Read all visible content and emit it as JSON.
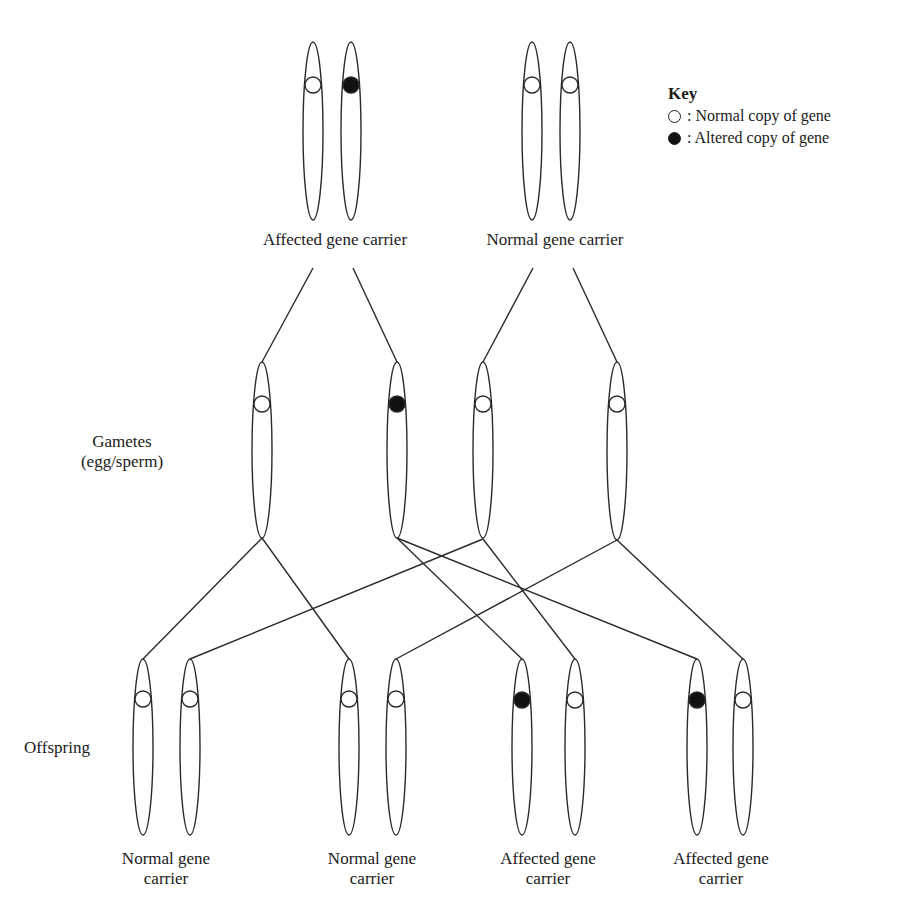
{
  "key": {
    "title": "Key",
    "items": [
      {
        "symbol": "open-circle",
        "label": ": Normal copy of gene"
      },
      {
        "symbol": "filled-circle",
        "label": ": Altered copy of gene"
      }
    ]
  },
  "parents": [
    {
      "label": "Affected gene carrier",
      "alleles": [
        "normal",
        "altered"
      ]
    },
    {
      "label": "Normal gene carrier",
      "alleles": [
        "normal",
        "normal"
      ]
    }
  ],
  "rows": {
    "gametes_label_1": "Gametes",
    "gametes_label_2": "(egg/sperm)",
    "offspring_label": "Offspring"
  },
  "gametes": [
    {
      "allele": "normal"
    },
    {
      "allele": "altered"
    },
    {
      "allele": "normal"
    },
    {
      "allele": "normal"
    }
  ],
  "offspring": [
    {
      "line1": "Normal gene",
      "line2": "carrier",
      "alleles": [
        "normal",
        "normal"
      ]
    },
    {
      "line1": "Normal gene",
      "line2": "carrier",
      "alleles": [
        "normal",
        "normal"
      ]
    },
    {
      "line1": "Affected gene",
      "line2": "carrier",
      "alleles": [
        "altered",
        "normal"
      ]
    },
    {
      "line1": "Affected gene",
      "line2": "carrier",
      "alleles": [
        "altered",
        "normal"
      ]
    }
  ]
}
